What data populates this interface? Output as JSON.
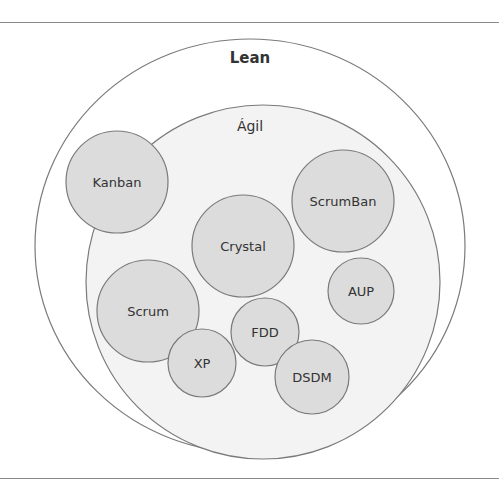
{
  "diagram": {
    "outer": {
      "label": "Lean",
      "cx": 250,
      "cy": 246,
      "rx": 215,
      "ry": 207,
      "fill": "#ffffff",
      "stroke": "#7a7a7a"
    },
    "inner": {
      "label": "Ágil",
      "cx": 263,
      "cy": 282,
      "r": 177,
      "fill": "#f3f3f3",
      "stroke": "#7a7a7a"
    },
    "circle_fill": "#dcdcdc",
    "circle_stroke": "#7a7a7a",
    "methods": [
      {
        "label": "Kanban",
        "cx": 117,
        "cy": 182,
        "r": 51
      },
      {
        "label": "ScrumBan",
        "cx": 343,
        "cy": 201,
        "r": 51
      },
      {
        "label": "Crystal",
        "cx": 243,
        "cy": 246,
        "r": 51
      },
      {
        "label": "AUP",
        "cx": 361,
        "cy": 291,
        "r": 33
      },
      {
        "label": "Scrum",
        "cx": 148,
        "cy": 311,
        "r": 51
      },
      {
        "label": "FDD",
        "cx": 265,
        "cy": 332,
        "r": 34
      },
      {
        "label": "XP",
        "cx": 202,
        "cy": 363,
        "r": 34
      },
      {
        "label": "DSDM",
        "cx": 312,
        "cy": 377,
        "r": 37
      }
    ]
  }
}
